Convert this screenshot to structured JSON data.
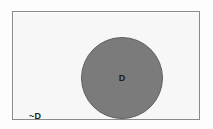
{
  "diagram": {
    "type": "venn-euler",
    "universe": {
      "label": "~D",
      "fill_color": "#f7f7f7",
      "border_color": "#8a8a8a"
    },
    "sets": [
      {
        "label": "D",
        "shaded": true,
        "fill_color": "#7b7b7b",
        "border_color": "#5f5f5f"
      }
    ],
    "background_color": "#fdfdfd",
    "text_color": "#1c1c1c"
  }
}
